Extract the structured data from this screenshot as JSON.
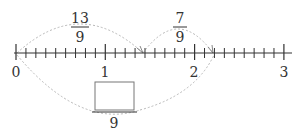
{
  "number_line": {
    "start": 0,
    "end": 3,
    "subdivisions_per_unit": 9,
    "major_labels": [
      "0",
      "1",
      "2",
      "3"
    ],
    "line_color": "#333333"
  },
  "upper_arcs": [
    {
      "from": "0",
      "to": "13/9",
      "label_numerator": "13",
      "label_denominator": "9"
    },
    {
      "from": "13/9",
      "to": "20/9",
      "label_numerator": "7",
      "label_denominator": "9"
    }
  ],
  "lower_arc": {
    "from": "0",
    "to": "20/9",
    "answer_box": "",
    "label_denominator": "9"
  },
  "colors": {
    "arc": "#b8b8b8",
    "box": "#777777",
    "text": "#333333"
  }
}
